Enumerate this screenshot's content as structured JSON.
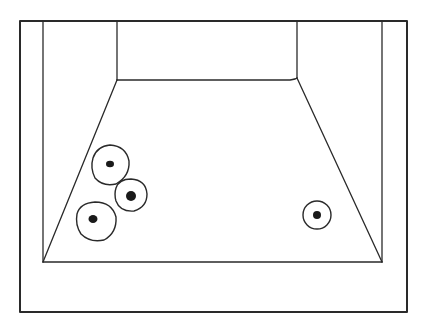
{
  "header": {
    "left_text": "",
    "right_text": ""
  },
  "diagram": {
    "stroke_color": "#2a2a2a",
    "outer_frame": {
      "x1": 20,
      "y1": 21,
      "x2": 407,
      "y2": 312
    },
    "side_walls": {
      "left_x": 43,
      "right_x": 382,
      "top_y": 21,
      "floor_front_y": 262
    },
    "back_wall": {
      "left_x": 117,
      "right_x": 297,
      "top_y": 21,
      "bottom_y": 80
    },
    "circles": [
      {
        "cx": 110,
        "cy": 165,
        "r": 19,
        "dot_r": 3.5
      },
      {
        "cx": 131,
        "cy": 195,
        "r": 16,
        "dot_r": 5
      },
      {
        "cx": 96,
        "cy": 221,
        "r": 20,
        "dot_r": 4.5
      },
      {
        "cx": 317,
        "cy": 215,
        "r": 14,
        "dot_r": 4
      }
    ]
  }
}
